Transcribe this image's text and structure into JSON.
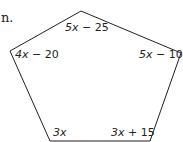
{
  "fragment_text": "n.",
  "figure": {
    "shape": "pentagon",
    "stroke_color": "#231f20",
    "vertices": [
      [
        81,
        11
      ],
      [
        181,
        53
      ],
      [
        150,
        141
      ],
      [
        50,
        141
      ],
      [
        10,
        51
      ]
    ],
    "angles": [
      {
        "vertex": "top",
        "var": "5x",
        "rest": " − 25",
        "label": "5x − 25"
      },
      {
        "vertex": "right",
        "var": "5x",
        "rest": " − 10",
        "label": "5x − 10"
      },
      {
        "vertex": "bottom-right",
        "var": "3x",
        "rest": " + 15",
        "label": "3x + 15"
      },
      {
        "vertex": "bottom-left",
        "var": "3x",
        "rest": "",
        "label": "3x"
      },
      {
        "vertex": "left",
        "var": "4x",
        "rest": " − 20",
        "label": "4x − 20"
      }
    ]
  }
}
